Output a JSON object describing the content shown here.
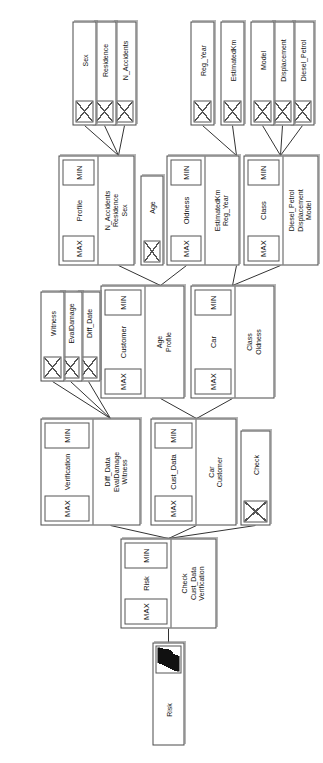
{
  "diagram": {
    "orientation": "rotated-90-ccw",
    "aggregator_labels": {
      "min": "MIN",
      "max": "MAX"
    },
    "colors": {
      "node_border": "#4a4a4a",
      "node_fill": "#ffffff",
      "edge": "#333333",
      "glyph": "#111111"
    },
    "nodes": [
      {
        "id": "risk_root",
        "kind": "root-leaf",
        "label": "Risk",
        "icon": "risk-glyph-icon"
      },
      {
        "id": "check_cust",
        "kind": "composite",
        "label": "Risk",
        "min": "MIN",
        "max": "MAX",
        "children_labels": [
          "Check",
          "Cust_Data",
          "Verification"
        ]
      },
      {
        "id": "check",
        "kind": "leaf",
        "label": "Check"
      },
      {
        "id": "cust_data",
        "kind": "composite",
        "label": "Cust_Data",
        "min": "MIN",
        "max": "MAX",
        "children_labels": [
          "Car",
          "Customer"
        ]
      },
      {
        "id": "verification",
        "kind": "composite",
        "label": "Verification",
        "min": "MIN",
        "max": "MAX",
        "children_labels": [
          "Diff_Data",
          "EvalDamage",
          "Witness"
        ]
      },
      {
        "id": "car",
        "kind": "composite",
        "label": "Car",
        "min": "MIN",
        "max": "MAX",
        "children_labels": [
          "Class",
          "Oldness"
        ]
      },
      {
        "id": "customer",
        "kind": "composite",
        "label": "Customer",
        "min": "MIN",
        "max": "MAX",
        "children_labels": [
          "Age",
          "Profile"
        ]
      },
      {
        "id": "diff_date",
        "kind": "leaf",
        "label": "Diff_Date"
      },
      {
        "id": "evaldamage",
        "kind": "leaf",
        "label": "EvalDamage"
      },
      {
        "id": "witness",
        "kind": "leaf",
        "label": "Witness"
      },
      {
        "id": "class",
        "kind": "composite",
        "label": "Class",
        "min": "MIN",
        "max": "MAX",
        "children_labels": [
          "Diesel_Petrol",
          "Displacement",
          "Model"
        ]
      },
      {
        "id": "oldness",
        "kind": "composite",
        "label": "Oldness",
        "min": "MIN",
        "max": "MAX",
        "children_labels": [
          "EstimatedKm",
          "Reg_Year"
        ]
      },
      {
        "id": "age",
        "kind": "leaf",
        "label": "Age"
      },
      {
        "id": "profile",
        "kind": "composite",
        "label": "Profile",
        "min": "MIN",
        "max": "MAX",
        "children_labels": [
          "N_Accidents",
          "Residence",
          "Sex"
        ]
      },
      {
        "id": "diesel_petrol",
        "kind": "leaf",
        "label": "Diesel_Petrol"
      },
      {
        "id": "displacement",
        "kind": "leaf",
        "label": "Displacement"
      },
      {
        "id": "model",
        "kind": "leaf",
        "label": "Model"
      },
      {
        "id": "estimatedkm",
        "kind": "leaf",
        "label": "EstimatedKm"
      },
      {
        "id": "reg_year",
        "kind": "leaf",
        "label": "Reg_Year"
      },
      {
        "id": "n_accidents",
        "kind": "leaf",
        "label": "N_Accidents"
      },
      {
        "id": "residence",
        "kind": "leaf",
        "label": "Residence"
      },
      {
        "id": "sex",
        "kind": "leaf",
        "label": "Sex"
      }
    ],
    "edges": [
      [
        "risk_root",
        "check_cust"
      ],
      [
        "check_cust",
        "check"
      ],
      [
        "check_cust",
        "cust_data"
      ],
      [
        "check_cust",
        "verification"
      ],
      [
        "cust_data",
        "car"
      ],
      [
        "cust_data",
        "customer"
      ],
      [
        "verification",
        "diff_date"
      ],
      [
        "verification",
        "evaldamage"
      ],
      [
        "verification",
        "witness"
      ],
      [
        "car",
        "class"
      ],
      [
        "car",
        "oldness"
      ],
      [
        "customer",
        "age"
      ],
      [
        "customer",
        "profile"
      ],
      [
        "class",
        "diesel_petrol"
      ],
      [
        "class",
        "displacement"
      ],
      [
        "class",
        "model"
      ],
      [
        "oldness",
        "estimatedkm"
      ],
      [
        "oldness",
        "reg_year"
      ],
      [
        "profile",
        "n_accidents"
      ],
      [
        "profile",
        "residence"
      ],
      [
        "profile",
        "sex"
      ]
    ]
  }
}
